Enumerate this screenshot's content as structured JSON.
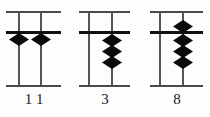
{
  "figure": {
    "kind": "soroban-abacus-diagram",
    "bead_shape": "diamond",
    "colors": {
      "bead": "#0a0a0a",
      "reckoning_bar": "#111111",
      "frame": "#4a4a4a",
      "rod": "#555555",
      "background": "#ffffff",
      "label_text": "#1a1a1a"
    }
  },
  "abacuses": [
    {
      "id": "abacus-1",
      "value_label": "1 1",
      "rods": [
        {
          "id": "rod-1",
          "heaven_beads": 0,
          "earth_beads_active": 1,
          "digit": "1"
        },
        {
          "id": "rod-2",
          "heaven_beads": 0,
          "earth_beads_active": 1,
          "digit": "1"
        }
      ]
    },
    {
      "id": "abacus-2",
      "value_label": "3",
      "rods": [
        {
          "id": "rod-1",
          "heaven_beads": 0,
          "earth_beads_active": 0,
          "digit": ""
        },
        {
          "id": "rod-2",
          "heaven_beads": 0,
          "earth_beads_active": 3,
          "digit": "3"
        }
      ]
    },
    {
      "id": "abacus-3",
      "value_label": "8",
      "rods": [
        {
          "id": "rod-1",
          "heaven_beads": 0,
          "earth_beads_active": 0,
          "digit": ""
        },
        {
          "id": "rod-2",
          "heaven_beads": 1,
          "earth_beads_active": 3,
          "digit": "8"
        }
      ]
    }
  ],
  "labels": {
    "abacus_1": "1 1",
    "abacus_2": "3",
    "abacus_3": "8"
  }
}
